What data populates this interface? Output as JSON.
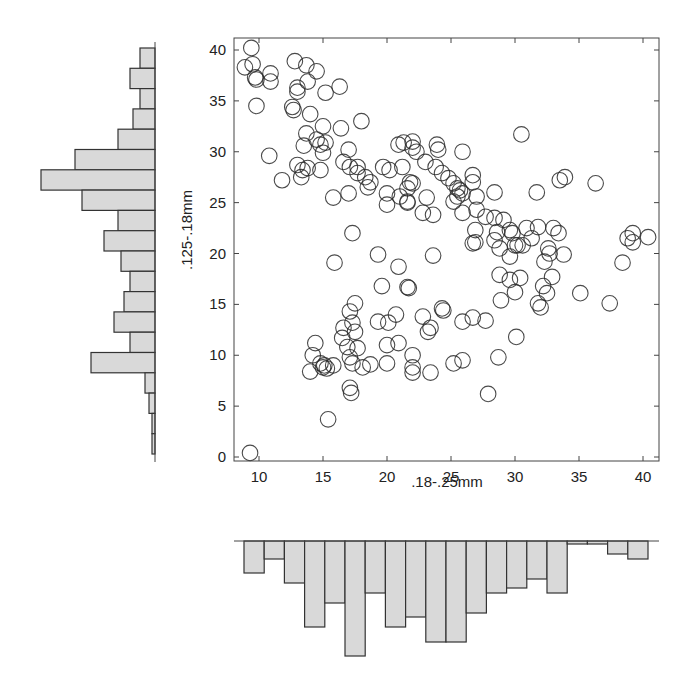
{
  "chart_data": [
    {
      "type": "scatter",
      "title": "",
      "xlabel": ".18-.25mm",
      "ylabel": ".125-.18mm",
      "xlim": [
        8.2,
        41.3
      ],
      "ylim": [
        -0.5,
        41.0
      ],
      "xticks": [
        10,
        15,
        20,
        25,
        30,
        35,
        40
      ],
      "yticks": [
        0,
        5,
        10,
        15,
        20,
        25,
        30,
        35,
        40
      ],
      "grid": false,
      "marker": "open-circle",
      "points": [
        [
          9.4,
          40.2
        ],
        [
          8.9,
          38.3
        ],
        [
          9.5,
          38.6
        ],
        [
          9.7,
          37.3
        ],
        [
          9.8,
          37.1
        ],
        [
          10.9,
          37.7
        ],
        [
          10.9,
          36.9
        ],
        [
          9.8,
          34.5
        ],
        [
          12.8,
          38.9
        ],
        [
          13.7,
          38.5
        ],
        [
          14.5,
          37.9
        ],
        [
          13.8,
          36.9
        ],
        [
          13.0,
          36.3
        ],
        [
          13.0,
          35.9
        ],
        [
          15.2,
          35.8
        ],
        [
          16.3,
          36.4
        ],
        [
          12.6,
          34.4
        ],
        [
          12.7,
          34.1
        ],
        [
          14.0,
          33.7
        ],
        [
          15.0,
          32.5
        ],
        [
          16.4,
          32.3
        ],
        [
          18.0,
          33.0
        ],
        [
          13.7,
          31.8
        ],
        [
          14.5,
          31.2
        ],
        [
          14.8,
          30.7
        ],
        [
          15.2,
          30.9
        ],
        [
          13.5,
          30.6
        ],
        [
          15.0,
          29.9
        ],
        [
          10.8,
          29.6
        ],
        [
          17.0,
          30.2
        ],
        [
          13.0,
          28.7
        ],
        [
          13.4,
          28.2
        ],
        [
          13.3,
          27.5
        ],
        [
          13.8,
          28.4
        ],
        [
          14.8,
          28.2
        ],
        [
          11.8,
          27.2
        ],
        [
          16.6,
          29.0
        ],
        [
          17.1,
          28.5
        ],
        [
          17.7,
          28.5
        ],
        [
          17.7,
          27.9
        ],
        [
          18.3,
          27.5
        ],
        [
          18.7,
          27.0
        ],
        [
          18.5,
          26.5
        ],
        [
          15.8,
          25.5
        ],
        [
          17.0,
          25.9
        ],
        [
          20.9,
          30.7
        ],
        [
          22.0,
          30.4
        ],
        [
          19.7,
          28.5
        ],
        [
          20.2,
          28.2
        ],
        [
          21.2,
          28.5
        ],
        [
          21.8,
          27.0
        ],
        [
          20.0,
          25.9
        ],
        [
          21.0,
          25.6
        ],
        [
          20.0,
          24.8
        ],
        [
          21.6,
          25.0
        ],
        [
          17.3,
          22.0
        ],
        [
          21.3,
          30.9
        ],
        [
          22.0,
          31.0
        ],
        [
          22.3,
          30.0
        ],
        [
          23.9,
          30.7
        ],
        [
          24.0,
          30.2
        ],
        [
          25.9,
          30.0
        ],
        [
          30.5,
          31.7
        ],
        [
          23.0,
          29.0
        ],
        [
          23.8,
          28.5
        ],
        [
          24.3,
          27.9
        ],
        [
          24.8,
          27.4
        ],
        [
          25.2,
          26.9
        ],
        [
          25.5,
          26.4
        ],
        [
          25.7,
          26.2
        ],
        [
          25.9,
          25.9
        ],
        [
          25.5,
          25.6
        ],
        [
          25.2,
          25.1
        ],
        [
          26.7,
          27.7
        ],
        [
          26.7,
          27.0
        ],
        [
          27.0,
          25.6
        ],
        [
          28.4,
          26.0
        ],
        [
          31.7,
          26.0
        ],
        [
          21.6,
          26.4
        ],
        [
          22.0,
          26.9
        ],
        [
          21.6,
          25.1
        ],
        [
          23.1,
          25.5
        ],
        [
          22.8,
          24.0
        ],
        [
          23.6,
          23.8
        ],
        [
          25.9,
          24.0
        ],
        [
          27.0,
          24.3
        ],
        [
          27.7,
          23.6
        ],
        [
          28.4,
          23.5
        ],
        [
          29.1,
          23.3
        ],
        [
          26.9,
          22.3
        ],
        [
          26.9,
          21.1
        ],
        [
          28.6,
          22.1
        ],
        [
          29.6,
          22.3
        ],
        [
          30.9,
          22.5
        ],
        [
          31.3,
          21.5
        ],
        [
          30.0,
          20.8
        ],
        [
          33.5,
          27.2
        ],
        [
          33.9,
          27.5
        ],
        [
          36.3,
          26.9
        ],
        [
          29.8,
          22.0
        ],
        [
          31.8,
          22.6
        ],
        [
          33.0,
          22.5
        ],
        [
          33.4,
          22.0
        ],
        [
          28.4,
          21.3
        ],
        [
          28.8,
          20.5
        ],
        [
          29.6,
          19.7
        ],
        [
          30.2,
          20.8
        ],
        [
          30.6,
          20.8
        ],
        [
          32.6,
          20.5
        ],
        [
          32.7,
          20.0
        ],
        [
          33.8,
          19.9
        ],
        [
          32.3,
          19.2
        ],
        [
          38.8,
          21.5
        ],
        [
          39.2,
          22.0
        ],
        [
          39.2,
          21.1
        ],
        [
          40.4,
          21.6
        ],
        [
          38.4,
          19.1
        ],
        [
          28.8,
          17.9
        ],
        [
          29.6,
          17.4
        ],
        [
          30.4,
          17.6
        ],
        [
          32.9,
          17.7
        ],
        [
          32.2,
          16.8
        ],
        [
          32.5,
          16.1
        ],
        [
          30.0,
          16.2
        ],
        [
          35.1,
          16.1
        ],
        [
          37.4,
          15.1
        ],
        [
          31.8,
          15.1
        ],
        [
          32.0,
          14.7
        ],
        [
          26.7,
          21.0
        ],
        [
          15.9,
          19.1
        ],
        [
          19.3,
          19.9
        ],
        [
          23.6,
          19.8
        ],
        [
          20.9,
          18.7
        ],
        [
          19.6,
          16.8
        ],
        [
          21.6,
          16.7
        ],
        [
          21.7,
          16.6
        ],
        [
          17.5,
          15.1
        ],
        [
          17.1,
          14.3
        ],
        [
          17.3,
          13.2
        ],
        [
          16.6,
          12.7
        ],
        [
          17.5,
          12.3
        ],
        [
          16.5,
          11.7
        ],
        [
          19.3,
          13.3
        ],
        [
          20.1,
          13.2
        ],
        [
          20.7,
          14.0
        ],
        [
          22.8,
          13.8
        ],
        [
          24.3,
          14.6
        ],
        [
          24.4,
          14.4
        ],
        [
          23.4,
          12.7
        ],
        [
          23.2,
          12.3
        ],
        [
          25.9,
          13.3
        ],
        [
          26.7,
          13.7
        ],
        [
          27.7,
          13.4
        ],
        [
          14.4,
          11.2
        ],
        [
          14.2,
          10.0
        ],
        [
          14.8,
          9.2
        ],
        [
          15.0,
          8.8
        ],
        [
          14.0,
          8.4
        ],
        [
          15.8,
          9.0
        ],
        [
          16.9,
          10.8
        ],
        [
          17.1,
          9.8
        ],
        [
          17.7,
          10.7
        ],
        [
          17.3,
          9.2
        ],
        [
          18.1,
          8.8
        ],
        [
          18.7,
          9.1
        ],
        [
          20.0,
          9.2
        ],
        [
          20.0,
          11.0
        ],
        [
          20.9,
          11.2
        ],
        [
          22.0,
          10.0
        ],
        [
          22.0,
          8.8
        ],
        [
          22.0,
          8.3
        ],
        [
          23.4,
          8.3
        ],
        [
          25.2,
          9.2
        ],
        [
          25.9,
          9.5
        ],
        [
          17.1,
          6.8
        ],
        [
          17.2,
          6.3
        ],
        [
          15.4,
          3.7
        ],
        [
          28.9,
          15.4
        ],
        [
          30.1,
          11.8
        ],
        [
          28.7,
          9.8
        ],
        [
          27.9,
          6.2
        ],
        [
          9.3,
          0.4
        ],
        [
          15.1,
          9.0
        ],
        [
          15.3,
          8.7
        ]
      ]
    },
    {
      "type": "bar",
      "orientation": "horizontal",
      "title": "",
      "description": "Marginal histogram of y (.125-.18mm), bars extend left from axis",
      "bin_edges_y": [
        40,
        38,
        36,
        34,
        32,
        30,
        28,
        26,
        24,
        22,
        20,
        18,
        16,
        14,
        12,
        10,
        8,
        6,
        4,
        2,
        0
      ],
      "values": [
        15,
        25,
        15,
        22,
        37,
        80,
        114,
        73,
        37,
        51,
        34,
        25,
        31,
        41,
        25,
        64,
        10,
        6,
        3,
        3
      ]
    },
    {
      "type": "bar",
      "orientation": "vertical-inverted",
      "title": "",
      "description": "Marginal histogram of x (.18-.25mm), bars hang down from axis",
      "bin_edges_x": [
        9.5,
        11.0,
        12.6,
        14.2,
        15.8,
        17.4,
        19.0,
        20.5,
        22.1,
        23.7,
        25.3,
        26.9,
        28.5,
        30.1,
        31.7,
        33.3,
        34.9,
        36.4,
        38.0,
        39.6,
        41.2
      ],
      "values": [
        32,
        18,
        42,
        86,
        62,
        115,
        52,
        86,
        76,
        101,
        101,
        72,
        52,
        47,
        38,
        52,
        3,
        3,
        13,
        18
      ]
    }
  ],
  "style": {
    "marker_stroke": "#2a2a2a",
    "bar_fill": "#d9d9d9",
    "bar_stroke": "#333333",
    "axis_color": "#444444"
  }
}
